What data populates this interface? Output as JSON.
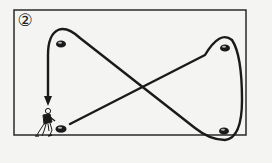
{
  "diagram": {
    "step_number": "②",
    "colors": {
      "background": "#f4f4f2",
      "line": "#1a1a1a",
      "frame": "#2a2a2a",
      "cone": "#1a1a1a"
    },
    "field_frame": {
      "x": 14,
      "y": 10,
      "width": 232,
      "height": 125
    },
    "cones": [
      {
        "name": "top-left",
        "cx": 61,
        "cy": 44
      },
      {
        "name": "top-right",
        "cx": 225,
        "cy": 48
      },
      {
        "name": "bottom-left",
        "cx": 60,
        "cy": 129
      },
      {
        "name": "bottom-right",
        "cx": 224,
        "cy": 131
      }
    ],
    "player": {
      "x": 30,
      "y": 107,
      "label": "player"
    },
    "path": {
      "type": "figure-eight",
      "direction_arrow": "down",
      "description": "Figure-eight run around four cones ending at bottom-left cone"
    }
  }
}
